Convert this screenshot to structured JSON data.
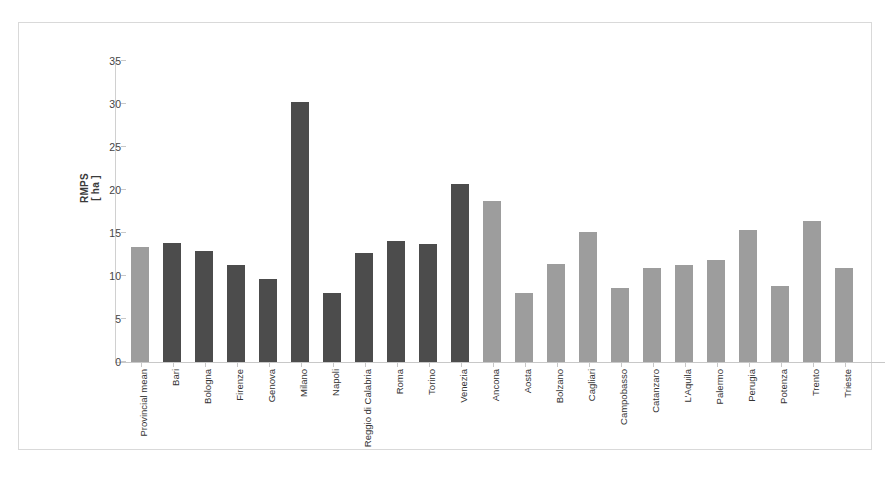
{
  "chart_data": {
    "type": "bar",
    "title": "",
    "subtitle": "",
    "xlabel": "",
    "ylabel": "RMPS [ ha ]",
    "ylabel_line1": "RMPS",
    "ylabel_line2": "[ ha ]",
    "ylim": [
      0,
      35
    ],
    "yticks": [
      0,
      5,
      10,
      15,
      20,
      25,
      30,
      35
    ],
    "grid": false,
    "legend": "none",
    "units": "ha",
    "categories": [
      "Provincial mean",
      "Bari",
      "Bologna",
      "Firenze",
      "Genova",
      "Milano",
      "Napoli",
      "Reggio di Calabria",
      "Roma",
      "Torino",
      "Venezia",
      "Ancona",
      "Aosta",
      "Bolzano",
      "Cagliari",
      "Campobasso",
      "Catanzaro",
      "L'Aquila",
      "Palermo",
      "Perugia",
      "Potenza",
      "Trento",
      "Trieste"
    ],
    "values": [
      13.4,
      13.8,
      12.9,
      11.3,
      9.6,
      30.2,
      8.0,
      12.7,
      14.1,
      13.7,
      20.7,
      18.7,
      8.0,
      11.4,
      15.1,
      8.6,
      10.9,
      11.3,
      11.9,
      15.3,
      8.8,
      16.4,
      10.9
    ],
    "bar_colors": [
      "#9d9d9d",
      "#4c4c4c",
      "#4c4c4c",
      "#4c4c4c",
      "#4c4c4c",
      "#4c4c4c",
      "#4c4c4c",
      "#4c4c4c",
      "#4c4c4c",
      "#4c4c4c",
      "#4c4c4c",
      "#9d9d9d",
      "#9d9d9d",
      "#9d9d9d",
      "#9d9d9d",
      "#9d9d9d",
      "#9d9d9d",
      "#9d9d9d",
      "#9d9d9d",
      "#9d9d9d",
      "#9d9d9d",
      "#9d9d9d",
      "#9d9d9d"
    ]
  },
  "style": {
    "dark_bar_color": "#4c4c4c",
    "light_bar_color": "#9d9d9d",
    "axis_color": "#c8c8c8",
    "frame_color": "#d9d9d9",
    "text_color": "#333333",
    "background": "#ffffff"
  }
}
